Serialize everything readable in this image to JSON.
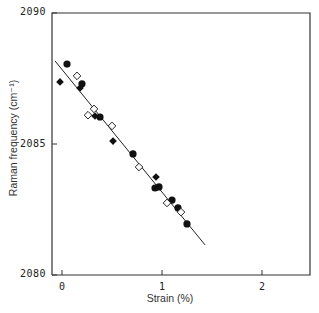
{
  "chart_data": {
    "type": "scatter",
    "title": "",
    "xlabel": "Strain (%)",
    "ylabel": "Raman frequency (cm⁻¹)",
    "xlim": [
      -0.1,
      2.48
    ],
    "ylim": [
      2080,
      2090
    ],
    "x_ticks": [
      0,
      1,
      2
    ],
    "x_tick_labels": [
      "0",
      "1",
      "2"
    ],
    "y_ticks": [
      2080,
      2085,
      2090
    ],
    "y_tick_labels": [
      "2080",
      "2085",
      "2090"
    ],
    "grid": false,
    "legend": null,
    "series": [
      {
        "name": "filled circles",
        "marker": "filled-circle",
        "points": [
          [
            0.05,
            2088.05
          ],
          [
            0.2,
            2087.3
          ],
          [
            0.38,
            2086.03
          ],
          [
            0.71,
            2084.62
          ],
          [
            0.93,
            2083.32
          ],
          [
            0.97,
            2083.36
          ],
          [
            1.1,
            2082.86
          ],
          [
            1.16,
            2082.56
          ],
          [
            1.25,
            2081.95
          ]
        ]
      },
      {
        "name": "filled diamonds",
        "marker": "filled-diamond",
        "points": [
          [
            -0.02,
            2087.37
          ],
          [
            0.18,
            2087.14
          ],
          [
            0.33,
            2086.07
          ],
          [
            0.51,
            2085.11
          ],
          [
            0.94,
            2083.74
          ]
        ]
      },
      {
        "name": "open diamonds",
        "marker": "open-diamond",
        "points": [
          [
            0.15,
            2087.6
          ],
          [
            0.26,
            2086.1
          ],
          [
            0.32,
            2086.34
          ],
          [
            0.5,
            2085.69
          ],
          [
            0.77,
            2084.12
          ],
          [
            1.05,
            2082.75
          ],
          [
            1.19,
            2082.4
          ]
        ]
      }
    ],
    "fit_line": {
      "name": "linear fit",
      "x": [
        -0.07,
        1.43
      ],
      "y": [
        2088.17,
        2081.15
      ],
      "slope_per_percent": -4.68
    }
  }
}
